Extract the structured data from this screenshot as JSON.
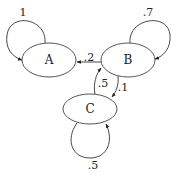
{
  "diagram": {
    "type": "markov-chain-state-diagram",
    "nodes": [
      {
        "id": "A",
        "label": "A"
      },
      {
        "id": "B",
        "label": "B"
      },
      {
        "id": "C",
        "label": "C"
      }
    ],
    "edges": [
      {
        "from": "A",
        "to": "A",
        "label": "1"
      },
      {
        "from": "B",
        "to": "B",
        "label": ".7"
      },
      {
        "from": "B",
        "to": "A",
        "label": ".2"
      },
      {
        "from": "B",
        "to": "C",
        "label": ".1"
      },
      {
        "from": "C",
        "to": "B",
        "label": ".5"
      },
      {
        "from": "C",
        "to": "C",
        "label": ".5"
      }
    ],
    "colors": {
      "stroke": "#555555",
      "text": "#222222",
      "background": "#ffffff"
    }
  }
}
